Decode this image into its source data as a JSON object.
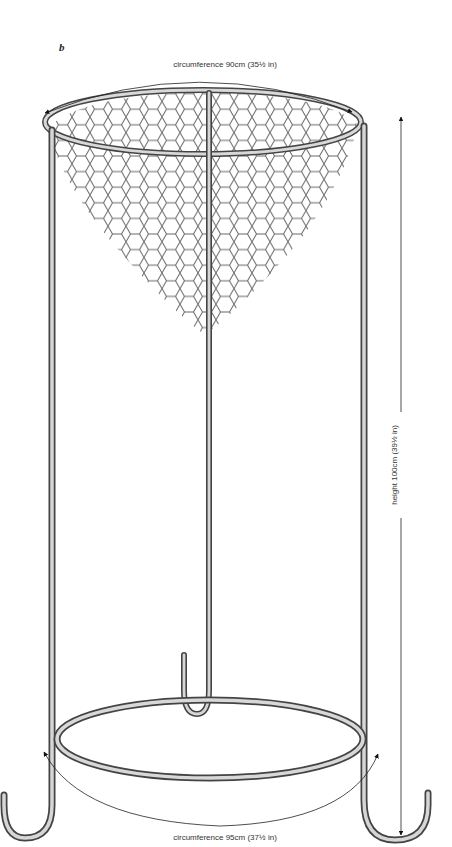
{
  "figure": {
    "panel_label": "b",
    "dimensions": {
      "top_circumference": "circumference 90cm (35½ in)",
      "bottom_circumference": "circumference 95cm (37½ in)",
      "height": "height 100cm (39½ in)"
    },
    "colors": {
      "line": "#333333",
      "rod_fill": "#cfcfcf",
      "mesh": "#555555",
      "background": "#ffffff"
    }
  }
}
